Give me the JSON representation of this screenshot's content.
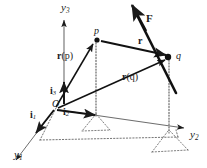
{
  "figure": {
    "background_color": "#ffffff",
    "ink_color": "#1a1a1a",
    "width": 207,
    "height": 168
  },
  "axes": [
    {
      "key": "y1",
      "label_base": "y",
      "label_sub": "1",
      "description": "axis toward viewer, lower-left",
      "x": 14,
      "y": 150
    },
    {
      "key": "y2",
      "label_base": "y",
      "label_sub": "2",
      "description": "axis to the right",
      "x": 190,
      "y": 130
    },
    {
      "key": "y3",
      "label_base": "y",
      "label_sub": "3",
      "description": "vertical axis, upward",
      "x": 61,
      "y": 3
    }
  ],
  "basis_vectors": [
    {
      "key": "i1",
      "label_base": "i",
      "label_sub": "1",
      "x": 33,
      "y": 111,
      "description": "unit vector along y1"
    },
    {
      "key": "i2",
      "label_base": "i",
      "label_sub": "2",
      "x": 64,
      "y": 108,
      "description": "unit vector along y2"
    },
    {
      "key": "i3",
      "label_base": "i",
      "label_sub": "3",
      "x": 51,
      "y": 88,
      "description": "unit vector along y3"
    }
  ],
  "origin": {
    "key": "O",
    "label": "O",
    "x": 55,
    "y": 107
  },
  "points": [
    {
      "key": "p",
      "label": "p",
      "x": 96,
      "y": 36,
      "description": "material point p"
    },
    {
      "key": "q",
      "label": "q",
      "x": 170,
      "y": 57,
      "description": "material point q"
    }
  ],
  "vectors": [
    {
      "key": "r_p",
      "label_bold": "r",
      "label_arg": "(p)",
      "label_x": 59,
      "label_y": 53,
      "description": "position vector of p from origin O"
    },
    {
      "key": "r_q",
      "label_bold": "r",
      "label_arg": "(q)",
      "label_x": 124,
      "label_y": 74,
      "description": "position vector of q from origin O"
    },
    {
      "key": "r_rel",
      "label_bold": "r",
      "label_arg": "",
      "label_x": 139,
      "label_y": 40,
      "description": "relative vector from p to q"
    },
    {
      "key": "F",
      "label_bold": "F",
      "label_arg": "",
      "label_x": 145,
      "label_y": 12,
      "description": "force vector acting at q, line of action through q"
    }
  ],
  "construction": {
    "projection_lines": "dotted drop lines from p and q to the base plane",
    "base_plane": "dotted parallelogram in the y1-y2 plane"
  }
}
